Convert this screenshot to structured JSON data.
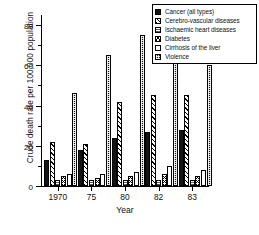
{
  "chart_data": {
    "type": "bar",
    "title": "",
    "xlabel": "Year",
    "ylabel": "Crude death rate per 100,000 population",
    "categories": [
      "1970",
      "75",
      "80",
      "82",
      "83"
    ],
    "ylim": [
      0,
      85
    ],
    "yticks": [
      0,
      20,
      40,
      60,
      80
    ],
    "ytick_labels": [
      "0",
      "20",
      "40",
      "60",
      "80"
    ],
    "grid": false,
    "legend_position": "top-right",
    "series": [
      {
        "name": "Cancer (all types)",
        "pattern": "solid",
        "values": [
          13,
          18,
          24,
          27,
          28
        ]
      },
      {
        "name": "Cerebro-vascular diseases",
        "pattern": "hatch",
        "values": [
          22,
          21,
          42,
          45,
          45
        ]
      },
      {
        "name": "Ischaemic heart diseases",
        "pattern": "fine",
        "values": [
          3,
          3,
          3,
          3,
          3
        ]
      },
      {
        "name": "Diabetes",
        "pattern": "cross",
        "values": [
          5,
          4,
          5,
          6,
          5
        ]
      },
      {
        "name": "Cirrhosis of the liver",
        "pattern": "open",
        "values": [
          6,
          6,
          7,
          10,
          8
        ]
      },
      {
        "name": "Violence",
        "pattern": "dots",
        "values": [
          46,
          65,
          75,
          63,
          60
        ]
      }
    ]
  }
}
